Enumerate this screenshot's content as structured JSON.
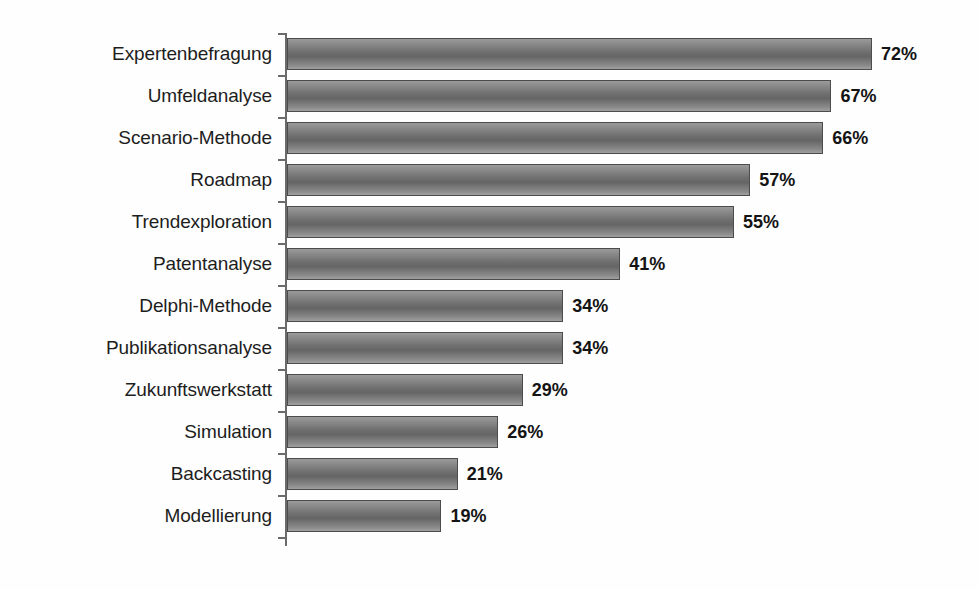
{
  "chart_data": {
    "type": "bar",
    "orientation": "horizontal",
    "title": "",
    "subtitle": "",
    "xlabel": "",
    "ylabel": "",
    "xlim": [
      0,
      72
    ],
    "grid": false,
    "legend": false,
    "value_suffix": "%",
    "categories": [
      "Expertenbefragung",
      "Umfeldanalyse",
      "Scenario-Methode",
      "Roadmap",
      "Trendexploration",
      "Patentanalyse",
      "Delphi-Methode",
      "Publikationsanalyse",
      "Zukunftswerkstatt",
      "Simulation",
      "Backcasting",
      "Modellierung"
    ],
    "values": [
      72,
      67,
      66,
      57,
      55,
      41,
      34,
      34,
      29,
      26,
      21,
      19
    ],
    "value_labels": [
      "72%",
      "67%",
      "66%",
      "57%",
      "55%",
      "41%",
      "34%",
      "34%",
      "29%",
      "26%",
      "21%",
      "19%"
    ],
    "series": [
      {
        "name": "Anteil",
        "values": [
          72,
          67,
          66,
          57,
          55,
          41,
          34,
          34,
          29,
          26,
          21,
          19
        ]
      }
    ],
    "colors": {
      "bar_fill_light": "#9b9b9b",
      "bar_fill_dark": "#656565",
      "bar_border": "#4c4c4c",
      "axis": "#6b6b6b",
      "label_text": "#1d1d1d",
      "value_text": "#141414",
      "background": "#fefefe"
    }
  }
}
